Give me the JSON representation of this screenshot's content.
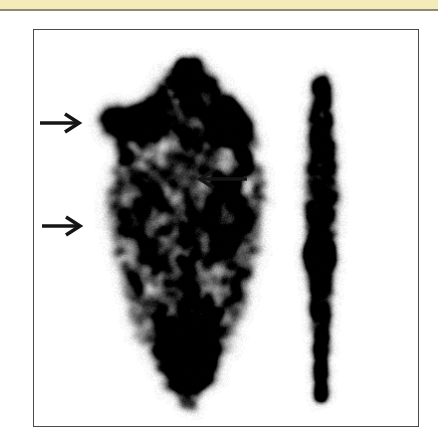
{
  "page": {
    "background_color": "#ffffff",
    "width": 438,
    "height": 439
  },
  "top_band": {
    "label": "page-header-strip",
    "fill_color": "#f3ecba",
    "rule_color": "#8e8a74"
  },
  "figure": {
    "label": "scintigraphy-figure",
    "frame_border_color": "#4a4a4a",
    "modality": "nuclear-medicine-scintigraphy",
    "view_count": 2,
    "panels": [
      {
        "name": "anterior-view",
        "description": "anterior planar scintigram of thorax showing rib cage tracer uptake"
      },
      {
        "name": "lateral-view",
        "description": "lateral planar scintigram showing narrow vertical spine column of tracer uptake"
      }
    ]
  },
  "annotations": {
    "arrow_color": "#151515",
    "arrows": [
      {
        "name": "arrow-upper-left",
        "direction": "right",
        "tail_x": 40,
        "tip_x": 79,
        "y": 123
      },
      {
        "name": "arrow-middle-right",
        "direction": "left",
        "tail_x": 247,
        "tip_x": 200,
        "y": 179
      },
      {
        "name": "arrow-lower-left",
        "direction": "right",
        "tail_x": 42,
        "tip_x": 80,
        "y": 226
      }
    ]
  },
  "scan_render": {
    "noise_seed": 20947,
    "background": "#ffffff",
    "anterior": {
      "center_x": 155,
      "top_y": 30,
      "bottom_y": 360,
      "hotspots": [
        {
          "name": "left-upper-intense-focus",
          "x": 95,
          "y": 92,
          "rx": 30,
          "ry": 14,
          "intensity": 0.96
        },
        {
          "name": "right-upper-intense-focus",
          "x": 193,
          "y": 95,
          "rx": 20,
          "ry": 20,
          "intensity": 0.94
        },
        {
          "name": "mid-left-uptake",
          "x": 100,
          "y": 180,
          "rx": 26,
          "ry": 40,
          "intensity": 0.42
        },
        {
          "name": "mid-right-uptake",
          "x": 190,
          "y": 185,
          "rx": 22,
          "ry": 44,
          "intensity": 0.45
        },
        {
          "name": "lower-mid-uptake",
          "x": 150,
          "y": 300,
          "rx": 34,
          "ry": 36,
          "intensity": 0.4
        }
      ]
    },
    "lateral": {
      "center_x": 288,
      "top_y": 48,
      "bottom_y": 372,
      "hotspots": [
        {
          "name": "vertebral-focal-hotspot",
          "x": 286,
          "y": 226,
          "rx": 13,
          "ry": 16,
          "intensity": 0.95
        }
      ]
    }
  }
}
